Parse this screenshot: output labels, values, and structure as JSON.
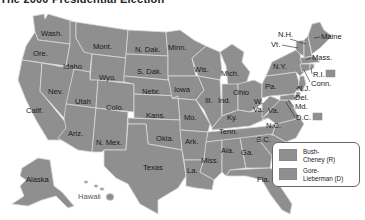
{
  "title": "The 2000 Presidential Election",
  "colors": {
    "bush_cheney_r": "#8f8f8f",
    "gore_lieberman_d": "#8f8f8f",
    "border": "#d8d8d8",
    "background": "#ffffff"
  },
  "legend": {
    "items": [
      {
        "label": "Bush-Cheney (R)",
        "line1": "Bush-",
        "line2": "Cheney (R)",
        "color": "#8f8f8f"
      },
      {
        "label": "Gore-Lieberman (D)",
        "line1": "Gore-",
        "line2": "Lieberman (D)",
        "color": "#8f8f8f"
      }
    ]
  },
  "states": {
    "wash": "Wash.",
    "ore": "Ore.",
    "calif": "Calif.",
    "idaho": "Idaho",
    "nev": "Nev.",
    "mont": "Mont.",
    "wyo": "Wyo.",
    "utah": "Utah",
    "ariz": "Ariz.",
    "colo": "Colo.",
    "nmex": "N. Mex.",
    "ndak": "N. Dak.",
    "sdak": "S. Dak.",
    "nebr": "Nebr.",
    "kans": "Kans.",
    "okla": "Okla.",
    "texas": "Texas",
    "minn": "Minn.",
    "iowa": "Iowa",
    "mo": "Mo.",
    "ark": "Ark.",
    "la": "La.",
    "wis": "Wis.",
    "ill": "Ill.",
    "mich": "Mich.",
    "ind": "Ind.",
    "ohio": "Ohio",
    "ky": "Ky.",
    "tenn": "Tenn.",
    "miss": "Miss.",
    "ala": "Ala.",
    "ga": "Ga.",
    "fla": "Fla.",
    "sc": "S.C.",
    "nc": "N.C.",
    "va": "Va.",
    "wva": "W.\nVa.",
    "wva_line1": "W.",
    "wva_line2": "Va.",
    "pa": "Pa.",
    "ny": "N.Y.",
    "vt": "Vt.",
    "nh": "N.H.",
    "maine": "Maine",
    "mass": "Mass.",
    "ri": "R.I.",
    "conn": "Conn.",
    "nj": "N.J.",
    "del": "Del.",
    "md": "Md.",
    "dc": "D.C.",
    "alaska": "Alaska",
    "hawaii": "Hawaii"
  }
}
